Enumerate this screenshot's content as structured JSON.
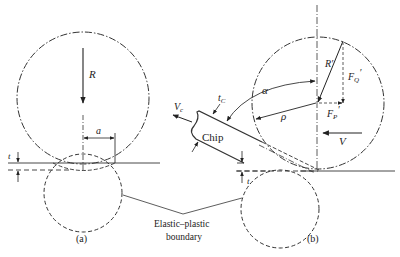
{
  "figure": {
    "panel_a": {
      "caption": "(a)",
      "labels": {
        "R": "R",
        "a": "a",
        "t": "t"
      }
    },
    "panel_b": {
      "caption": "(b)",
      "labels": {
        "Vc": "V",
        "Vc_sub": "c",
        "tC": "t",
        "tC_sub": "C",
        "chip": "Chip",
        "alpha": "α",
        "rho": "ρ",
        "R_prime": "R′",
        "FQ": "F",
        "FQ_sub": "Q",
        "FQ_prime": "′",
        "FP": "F",
        "FP_sub": "P",
        "FP_prime": "′",
        "V": "V",
        "t": "t"
      }
    },
    "boundary_label_line1": "Elastic–plastic",
    "boundary_label_line2": "boundary",
    "colors": {
      "line": "#333333",
      "text": "#222222",
      "background": "#ffffff"
    }
  }
}
